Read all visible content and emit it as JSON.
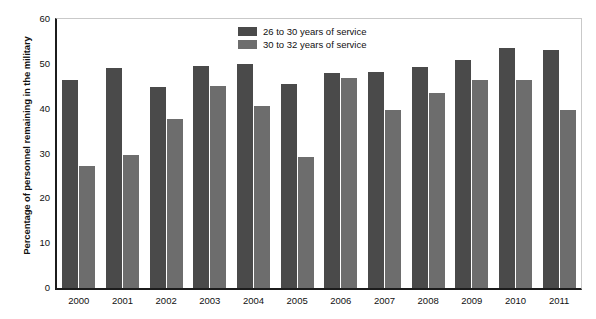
{
  "chart_data": {
    "type": "bar",
    "title": "",
    "xlabel": "",
    "ylabel": "Percentage of personnel remaining in the military",
    "ylim": [
      0,
      60
    ],
    "yticks": [
      0,
      10,
      20,
      30,
      40,
      50,
      60
    ],
    "grid": false,
    "legend_position": "top-center",
    "categories": [
      "2000",
      "2001",
      "2002",
      "2003",
      "2004",
      "2005",
      "2006",
      "2007",
      "2008",
      "2009",
      "2010",
      "2011"
    ],
    "series": [
      {
        "name": "26 to 30 years of service",
        "color": "#4a4a4a",
        "values": [
          46.5,
          49.0,
          44.8,
          49.5,
          50.0,
          45.5,
          48.0,
          48.2,
          49.2,
          50.8,
          53.6,
          53.0
        ]
      },
      {
        "name": "30 to 32 years of service",
        "color": "#6d6d6d",
        "values": [
          27.2,
          29.7,
          37.7,
          45.0,
          40.5,
          29.3,
          46.8,
          39.6,
          43.5,
          46.4,
          46.4,
          39.7
        ]
      }
    ]
  },
  "axes": {
    "y_title": "Percentage of personnel remaining in the military",
    "y_tick_labels": [
      "0",
      "10",
      "20",
      "30",
      "40",
      "50",
      "60"
    ],
    "x_tick_labels": [
      "2000",
      "2001",
      "2002",
      "2003",
      "2004",
      "2005",
      "2006",
      "2007",
      "2008",
      "2009",
      "2010",
      "2011"
    ]
  },
  "legend": {
    "items": [
      {
        "label": "26 to 30 years of service",
        "swatch": "dark"
      },
      {
        "label": "30 to 32 years of service",
        "swatch": "light"
      }
    ]
  }
}
